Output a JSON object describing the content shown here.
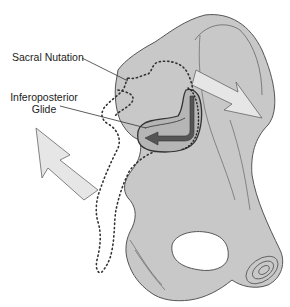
{
  "diagram": {
    "labels": {
      "sacral_nutation": "Sacral Nutation",
      "inferoposterior_glide_line1": "Inferoposterior",
      "inferoposterior_glide_line2": "Glide"
    },
    "colors": {
      "bone_fill": "#c8c8c8",
      "bone_outline": "#555555",
      "arrow_fill": "#e6e6e6",
      "joint_arrow": "#555555",
      "dotted_outline": "#333333",
      "foramen": "#ffffff"
    },
    "elements": [
      "ilium",
      "sacrum-dotted-outline",
      "sacroiliac-joint-surface",
      "nutation-arrow",
      "glide-arrow",
      "counternutation-arrow",
      "obturator-foramen",
      "pubic-symphysis"
    ]
  }
}
